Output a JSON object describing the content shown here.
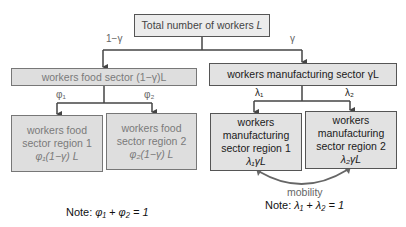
{
  "nodes": {
    "total": {
      "text": "Total number of workers",
      "var": "L"
    },
    "food_sector": {
      "text": "workers food sector",
      "expr": "(1−γ)L"
    },
    "manufacturing_sector": {
      "text": "workers manufacturing sector",
      "expr": "γL"
    },
    "food_region_1": {
      "line1": "workers food",
      "line2": "sector region 1",
      "expr": "φ₁(1−γ) L"
    },
    "food_region_2": {
      "line1": "workers food",
      "line2": "sector region 2",
      "expr": "φ₂(1−γ) L"
    },
    "manu_region_1": {
      "line1": "workers",
      "line2": "manufacturing",
      "line3": "sector region 1",
      "expr": "λ₁γL"
    },
    "manu_region_2": {
      "line1": "workers",
      "line2": "manufacturing",
      "line3": "sector region 2",
      "expr": "λ₂γL"
    }
  },
  "edges": {
    "to_food": "1−γ",
    "to_manufacturing": "γ",
    "phi1": "φ₁",
    "phi2": "φ₂",
    "lambda1": "λ₁",
    "lambda2": "λ₂",
    "mobility": "mobility"
  },
  "notes": {
    "food": {
      "prefix": "Note: ",
      "expr": "φ₁ + φ₂ = 1"
    },
    "manufacturing": {
      "prefix": "Note: ",
      "expr": "λ₁ + λ₂ = 1"
    }
  },
  "colors": {
    "line": "#444444",
    "box_fill": "#e2e2e2",
    "food_text": "#7a7a7a"
  }
}
